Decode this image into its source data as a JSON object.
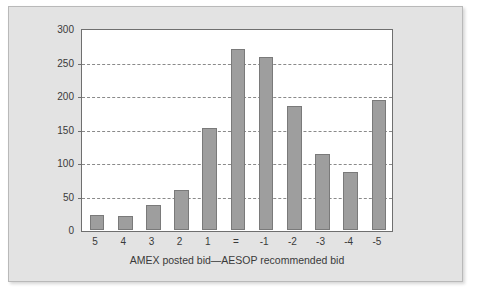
{
  "chart_data": {
    "type": "bar",
    "title": "",
    "subtitle": "",
    "xlabel": "AMEX posted bid—AESOP recommended bid",
    "ylabel": "Number of quotations",
    "categories": [
      "5",
      "4",
      "3",
      "2",
      "1",
      "=",
      "-1",
      "-2",
      "-3",
      "-4",
      "-5"
    ],
    "values": [
      22,
      21,
      38,
      60,
      152,
      270,
      258,
      185,
      113,
      87,
      194
    ],
    "ylim": [
      0,
      300
    ],
    "y_ticks": [
      0,
      50,
      100,
      150,
      200,
      250,
      300
    ],
    "y_tick_labels": [
      "0",
      "50",
      "100",
      "150",
      "200",
      "250",
      "300"
    ],
    "grid": "horizontal-dashed",
    "legend": null,
    "bar_color": "#9e9e9e",
    "bar_border_color": "#7a7a7a",
    "plot_background": "#ffffff",
    "panel_background": "#e3e3e3",
    "axis_color": "#6f6f6f",
    "gridline_color": "#8a8a8a",
    "text_color": "#3a3a3a"
  }
}
